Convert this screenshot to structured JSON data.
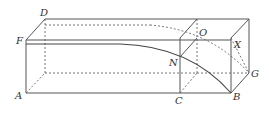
{
  "diagram": {
    "type": "geometry-solid",
    "stroke_color": "#555555",
    "labels": {
      "D": "D",
      "F": "F",
      "A": "A",
      "O": "O",
      "X": "X",
      "N": "N",
      "G": "G",
      "C": "C",
      "B": "B"
    },
    "points": {
      "D": [
        45,
        19
      ],
      "F": [
        26,
        40
      ],
      "A": [
        26,
        93
      ],
      "O": [
        197,
        38
      ],
      "X": [
        231,
        38
      ],
      "N": [
        180,
        57
      ],
      "G": [
        249,
        73
      ],
      "C": [
        180,
        93
      ],
      "B": [
        231,
        93
      ]
    }
  }
}
